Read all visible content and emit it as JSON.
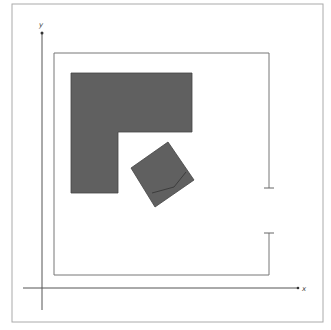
{
  "diagram": {
    "axes": {
      "x_label": "x",
      "y_label": "y"
    },
    "colors": {
      "shape_fill": "#606060",
      "line": "#555555",
      "frame": "#999999"
    },
    "shapes": [
      {
        "name": "l-shape",
        "points": "71,73 192,73 192,132 118,132 118,193 71,193"
      },
      {
        "name": "rotated-square",
        "points": "168,142 194,180 155,207 131,168"
      }
    ]
  }
}
